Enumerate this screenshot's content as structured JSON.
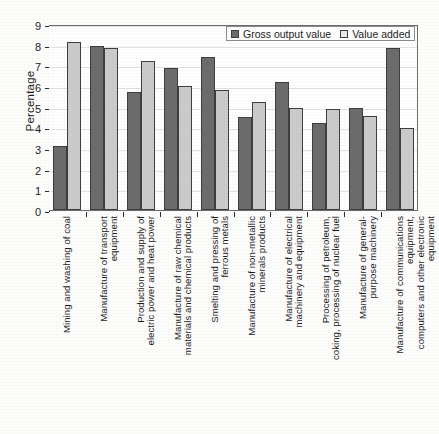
{
  "chart_data": {
    "type": "bar",
    "title": "",
    "xlabel": "",
    "ylabel": "Percentage",
    "ylim": [
      0,
      9
    ],
    "ytick_labels": [
      "0",
      "1",
      "2",
      "3",
      "4",
      "5",
      "6",
      "7",
      "8",
      "9"
    ],
    "grid": true,
    "legend_position": "top-right",
    "categories": [
      "Mining and washing of coal",
      "Manufacture of transport equipment",
      "Production and supply of electric power and heat power",
      "Manufacture of raw chemical materials and chemical products",
      "Smelting and pressing of ferrous metals",
      "Manufacture of non-metallic minerals products",
      "Manufacture of electrical machinery and equipment",
      "Processing of petroleum, coking, processing of nuclear fuel",
      "Manufacture of general-purpose machinery",
      "Manufacture of communications equipment, computers and other electronic equipment"
    ],
    "category_lines": [
      "Mining and washing of coal",
      "Manufacture of transport\nequipment",
      "Production and supply of\nelectric power and heat power",
      "Manufacture of raw chemical\nmaterials and chemical products",
      "Smelting and pressing of\nferrous metals",
      "Manufacture of non-metallic\nminerals products",
      "Manufacture of electrical\nmachinery and equipment",
      "Processing of petroleum,\ncoking, processing of nuclear fuel",
      "Manufacture of general-\npurpose machinery",
      "Manufacture of communications equipment,\ncomputers and other electronic equipment"
    ],
    "series": [
      {
        "name": "Gross output value",
        "color": "#6b6b6b",
        "values": [
          3.1,
          7.95,
          5.7,
          6.85,
          7.4,
          4.5,
          6.2,
          4.2,
          4.95,
          7.85
        ]
      },
      {
        "name": "Value added",
        "color": "#cbcbcb",
        "values": [
          8.15,
          7.85,
          7.2,
          6.0,
          5.8,
          5.25,
          4.95,
          4.9,
          4.55,
          3.95
        ]
      }
    ]
  },
  "legend": {
    "items": [
      {
        "label": "Gross output value",
        "swatch": "dark-gray-swatch"
      },
      {
        "label": "Value added",
        "swatch": "light-gray-swatch"
      }
    ]
  }
}
